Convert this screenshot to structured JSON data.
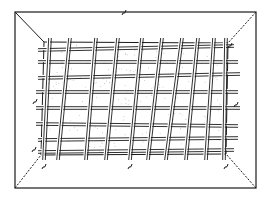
{
  "figure": {
    "kind": "technical line drawing",
    "colors": {
      "ink": "#1a1a1a",
      "paper": "#ffffff",
      "stipple": "#9a9a9a"
    },
    "outer_frame": {
      "x1": 15,
      "y1": 12,
      "x2": 256,
      "y2": 188
    },
    "inner_rim": {
      "top_left": [
        44,
        42
      ],
      "top_right": [
        228,
        43
      ],
      "bottom_right": [
        226,
        154
      ],
      "bottom_left": [
        41,
        155
      ]
    },
    "vertical_rods": [
      {
        "top": [
          50,
          38
        ],
        "bottom": [
          44,
          160
        ]
      },
      {
        "top": [
          70,
          38
        ],
        "bottom": [
          58,
          160
        ]
      },
      {
        "top": [
          96,
          38
        ],
        "bottom": [
          86,
          160
        ]
      },
      {
        "top": [
          118,
          38
        ],
        "bottom": [
          106,
          160
        ]
      },
      {
        "top": [
          142,
          38
        ],
        "bottom": [
          130,
          160
        ]
      },
      {
        "top": [
          162,
          38
        ],
        "bottom": [
          148,
          160
        ]
      },
      {
        "top": [
          182,
          38
        ],
        "bottom": [
          166,
          160
        ]
      },
      {
        "top": [
          198,
          38
        ],
        "bottom": [
          186,
          160
        ]
      },
      {
        "top": [
          214,
          38
        ],
        "bottom": [
          206,
          160
        ]
      },
      {
        "top": [
          226,
          38
        ],
        "bottom": [
          224,
          160
        ]
      }
    ],
    "horizontal_rods": [
      {
        "left": [
          38,
          50
        ],
        "right": [
          234,
          46
        ]
      },
      {
        "left": [
          38,
          62
        ],
        "right": [
          238,
          62
        ]
      },
      {
        "left": [
          38,
          78
        ],
        "right": [
          240,
          74
        ]
      },
      {
        "left": [
          36,
          92
        ],
        "right": [
          238,
          92
        ]
      },
      {
        "left": [
          36,
          108
        ],
        "right": [
          240,
          108
        ]
      },
      {
        "left": [
          36,
          124
        ],
        "right": [
          238,
          126
        ]
      },
      {
        "left": [
          38,
          140
        ],
        "right": [
          238,
          138
        ]
      },
      {
        "left": [
          38,
          152
        ],
        "right": [
          234,
          150
        ]
      }
    ],
    "reference_marks": [
      {
        "pos": [
          124,
          12
        ],
        "label": ""
      },
      {
        "pos": [
          230,
          45
        ],
        "label": ""
      },
      {
        "pos": [
          35,
          101
        ],
        "label": ""
      },
      {
        "pos": [
          236,
          104
        ],
        "label": ""
      },
      {
        "pos": [
          34,
          149
        ],
        "label": ""
      },
      {
        "pos": [
          44,
          166
        ],
        "label": ""
      },
      {
        "pos": [
          130,
          166
        ],
        "label": ""
      },
      {
        "pos": [
          226,
          166
        ],
        "label": ""
      }
    ]
  }
}
